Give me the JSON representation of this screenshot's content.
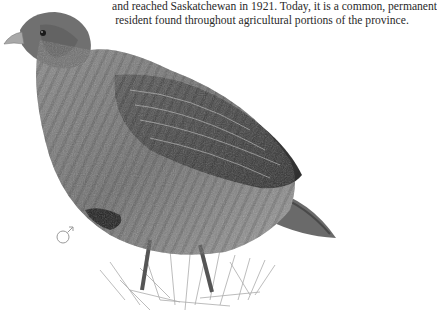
{
  "text": {
    "lines": [
      "and reached Saskatchewan in 1921. Today, it is a common, permanent",
      "resident found throughout agricultural portions of the province."
    ]
  },
  "illustration": {
    "subject": "gray-partridge",
    "sex_symbol": "♂"
  }
}
